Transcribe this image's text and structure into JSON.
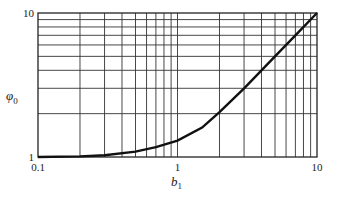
{
  "chart_data": {
    "type": "line",
    "title": "",
    "xlabel": "b",
    "xlabel_sub": "1",
    "ylabel": "φ",
    "ylabel_sub": "0",
    "xscale": "log",
    "yscale": "log",
    "xlim": [
      0.1,
      10
    ],
    "ylim": [
      1,
      10
    ],
    "grid": true,
    "x_ticks": [
      "0.1",
      "1",
      "10"
    ],
    "y_ticks": [
      "1",
      "10"
    ],
    "series": [
      {
        "name": "φ0(b1)",
        "x": [
          0.1,
          0.2,
          0.3,
          0.5,
          0.7,
          1.0,
          1.5,
          2.0,
          3.0,
          4.0,
          5.0,
          7.0,
          10.0
        ],
        "values": [
          1.0,
          1.01,
          1.03,
          1.09,
          1.17,
          1.3,
          1.6,
          2.05,
          3.0,
          4.0,
          5.0,
          7.0,
          10.0
        ]
      }
    ]
  }
}
